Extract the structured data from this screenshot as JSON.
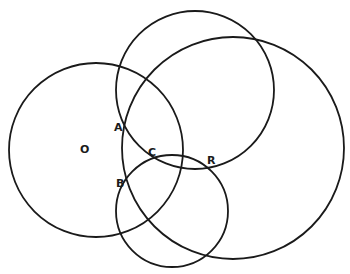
{
  "diagram": {
    "type": "intersecting-circles",
    "background": "#ffffff",
    "stroke_color": "#1a1a1a",
    "circles": [
      {
        "name": "circle-o",
        "cx": 96,
        "cy": 150,
        "r": 87
      },
      {
        "name": "circle-top",
        "cx": 195,
        "cy": 90,
        "r": 79
      },
      {
        "name": "circle-large",
        "cx": 233,
        "cy": 148,
        "r": 111
      },
      {
        "name": "circle-bottom",
        "cx": 172,
        "cy": 211,
        "r": 56
      }
    ],
    "labels": [
      {
        "name": "label-o",
        "text": "O",
        "x": 80,
        "y": 153
      },
      {
        "name": "label-a",
        "text": "A",
        "x": 114,
        "y": 131
      },
      {
        "name": "label-b",
        "text": "B",
        "x": 116,
        "y": 187
      },
      {
        "name": "label-c",
        "text": "C",
        "x": 148,
        "y": 156
      },
      {
        "name": "label-r",
        "text": "R",
        "x": 207,
        "y": 164
      }
    ]
  }
}
